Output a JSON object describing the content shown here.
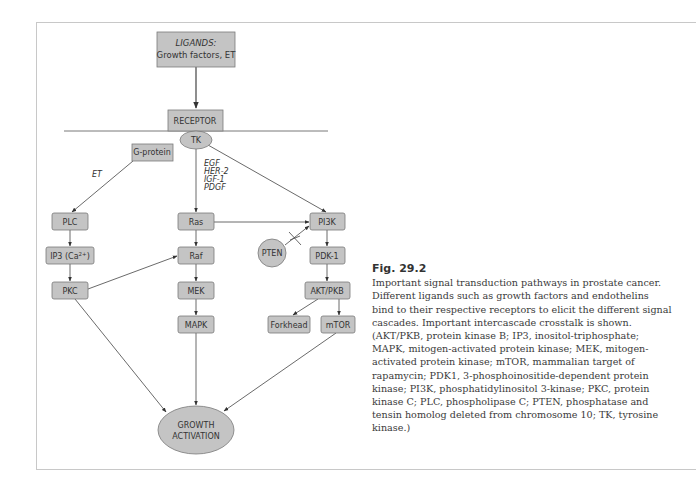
{
  "figure": {
    "title": "Fig. 29.2",
    "caption": "Important signal transduction pathways in prostate cancer. Different ligands such as growth factors and endothelins bind to their respective receptors to elicit the different signal cascades. Important intercascade crosstalk is shown. (AKT/PKB, protein kinase B; IP3, inositol-triphosphate; MAPK, mitogen-activated protein kinase; MEK, mitogen-activated protein kinase; mTOR, mammalian target of rapamycin; PDK1, 3-phosphoinositide-dependent protein kinase; PI3K, phosphatidylinositol 3-kinase; PKC, protein kinase C; PLC, phospholipase C; PTEN, phosphatase and tensin homolog deleted from chromosome 10; TK, tyrosine kinase.)"
  },
  "colors": {
    "node_fill": "#c4c4c4",
    "node_stroke": "#7a7a7a",
    "line": "#444444",
    "frame": "#c8c8c8"
  },
  "nodes": {
    "ligands_title": "LIGANDS:",
    "ligands_sub": "Growth factors, ET",
    "receptor": "RECEPTOR",
    "tk": "TK",
    "g_protein": "G-protein",
    "plc": "PLC",
    "ip3": "IP3 (Ca",
    "ip3_sup": "2+",
    "ip3_close": ")",
    "pkc": "PKC",
    "ras": "Ras",
    "raf": "Raf",
    "mek": "MEK",
    "mapk": "MAPK",
    "pi3k": "PI3K",
    "pten": "PTEN",
    "pdk1": "PDK-1",
    "akt": "AKT/PKB",
    "forkhead": "Forkhead",
    "mtor": "mTOR",
    "growth_line1": "GROWTH",
    "growth_line2": "ACTIVATION"
  },
  "edge_labels": {
    "et": "ET",
    "growth_factors": [
      "EGF",
      "HER-2",
      "IGF-1",
      "PDGF"
    ]
  }
}
